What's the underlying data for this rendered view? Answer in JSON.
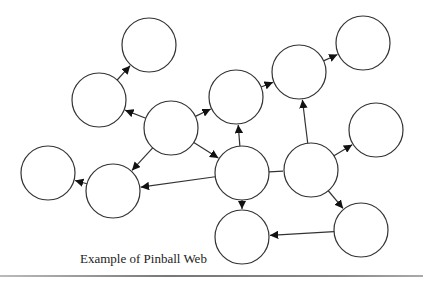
{
  "caption": "Example of Pinball Web",
  "style": {
    "stroke": "#333333",
    "fill": "#ffffff",
    "node_radius": 27
  },
  "nodes": [
    {
      "id": "n1",
      "cx": 149,
      "cy": 45
    },
    {
      "id": "n2",
      "cx": 99,
      "cy": 100
    },
    {
      "id": "n3",
      "cx": 171,
      "cy": 128
    },
    {
      "id": "n4",
      "cx": 236,
      "cy": 97
    },
    {
      "id": "n5",
      "cx": 299,
      "cy": 72
    },
    {
      "id": "n6",
      "cx": 363,
      "cy": 43
    },
    {
      "id": "n7",
      "cx": 48,
      "cy": 173
    },
    {
      "id": "n8",
      "cx": 113,
      "cy": 191
    },
    {
      "id": "n9",
      "cx": 242,
      "cy": 173
    },
    {
      "id": "n10",
      "cx": 311,
      "cy": 170
    },
    {
      "id": "n11",
      "cx": 376,
      "cy": 130
    },
    {
      "id": "n12",
      "cx": 242,
      "cy": 237
    },
    {
      "id": "n13",
      "cx": 361,
      "cy": 230
    }
  ],
  "edges": [
    {
      "from": "n2",
      "to": "n1",
      "arrow": true
    },
    {
      "from": "n3",
      "to": "n2",
      "arrow": true
    },
    {
      "from": "n3",
      "to": "n4",
      "arrow": true
    },
    {
      "from": "n3",
      "to": "n8",
      "arrow": true
    },
    {
      "from": "n3",
      "to": "n9",
      "arrow": true
    },
    {
      "from": "n4",
      "to": "n5",
      "arrow": true
    },
    {
      "from": "n5",
      "to": "n6",
      "arrow": true
    },
    {
      "from": "n9",
      "to": "n4",
      "arrow": true
    },
    {
      "from": "n10",
      "to": "n5",
      "arrow": true
    },
    {
      "from": "n9",
      "to": "n8",
      "arrow": true
    },
    {
      "from": "n8",
      "to": "n7",
      "arrow": true
    },
    {
      "from": "n9",
      "to": "n10",
      "arrow": false
    },
    {
      "from": "n10",
      "to": "n11",
      "arrow": true
    },
    {
      "from": "n9",
      "to": "n12",
      "arrow": true
    },
    {
      "from": "n10",
      "to": "n13",
      "arrow": true
    },
    {
      "from": "n13",
      "to": "n12",
      "arrow": true
    }
  ]
}
